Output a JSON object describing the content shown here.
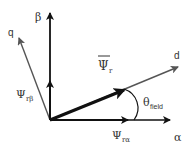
{
  "diagram": {
    "type": "vector-diagram",
    "axes": {
      "alpha": {
        "label": "α"
      },
      "beta": {
        "label": "β"
      },
      "d": {
        "label": "d"
      },
      "q": {
        "label": "q"
      }
    },
    "vectors": {
      "rotor_flux": {
        "label": "Ψ",
        "subscript": "r",
        "overbar": true
      },
      "rotor_flux_alpha": {
        "label": "Ψ",
        "subscript": "rα"
      },
      "rotor_flux_beta": {
        "label": "Ψ",
        "subscript": "rβ"
      }
    },
    "angle": {
      "label": "θ",
      "subscript": "field"
    },
    "colors": {
      "axis": "#111111",
      "rotated_axis": "#555555",
      "text": "#333333"
    }
  }
}
